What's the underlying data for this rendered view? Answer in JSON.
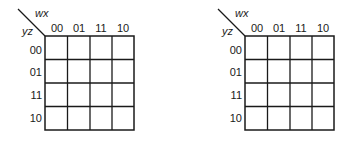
{
  "maps": [
    {
      "col_var": "wx",
      "row_var": "yz",
      "col_labels": [
        "00",
        "01",
        "11",
        "10"
      ],
      "row_labels": [
        "00",
        "01",
        "11",
        "10"
      ],
      "cells": [
        [
          "",
          "",
          "",
          ""
        ],
        [
          "",
          "",
          "",
          ""
        ],
        [
          "",
          "",
          "",
          ""
        ],
        [
          "",
          "",
          "",
          ""
        ]
      ]
    },
    {
      "col_var": "wx",
      "row_var": "yz",
      "col_labels": [
        "00",
        "01",
        "11",
        "10"
      ],
      "row_labels": [
        "00",
        "01",
        "11",
        "10"
      ],
      "cells": [
        [
          "",
          "",
          "",
          ""
        ],
        [
          "",
          "",
          "",
          ""
        ],
        [
          "",
          "",
          "",
          ""
        ],
        [
          "",
          "",
          "",
          ""
        ]
      ]
    }
  ],
  "colors": {
    "line": "#1a1a1a",
    "background": "#ffffff"
  }
}
